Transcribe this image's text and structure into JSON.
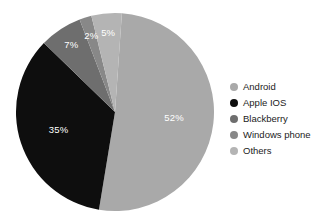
{
  "chart_data": {
    "type": "pie",
    "title": "",
    "subtitle": "",
    "xlabel": "",
    "ylabel": "",
    "grid": false,
    "legend_position": "right",
    "start_angle_deg": 4,
    "direction": "clockwise",
    "units": "percent",
    "total": 101,
    "categories": [
      "Android",
      "Apple IOS",
      "Blackberry",
      "Windows phone",
      "Others"
    ],
    "values": [
      52,
      35,
      7,
      2,
      5
    ],
    "data_labels": [
      "52%",
      "35%",
      "7%",
      "2%",
      "5%"
    ],
    "colors": [
      "#a9a9a9",
      "#0e0e0e",
      "#6e6e6e",
      "#888888",
      "#b4b4b4"
    ],
    "label_color": "#ffffff",
    "slices": [
      {
        "name": "Android",
        "value": 52,
        "label": "52%",
        "color": "#a9a9a9"
      },
      {
        "name": "Apple IOS",
        "value": 35,
        "label": "35%",
        "color": "#0e0e0e"
      },
      {
        "name": "Blackberry",
        "value": 7,
        "label": "7%",
        "color": "#6e6e6e"
      },
      {
        "name": "Windows phone",
        "value": 2,
        "label": "2%",
        "color": "#888888"
      },
      {
        "name": "Others",
        "value": 5,
        "label": "5%",
        "color": "#b4b4b4"
      }
    ]
  },
  "legend": {
    "items": [
      {
        "label": "Android",
        "color": "#a9a9a9"
      },
      {
        "label": "Apple IOS",
        "color": "#0e0e0e"
      },
      {
        "label": "Blackberry",
        "color": "#6e6e6e"
      },
      {
        "label": "Windows phone",
        "color": "#888888"
      },
      {
        "label": "Others",
        "color": "#b4b4b4"
      }
    ]
  },
  "slice_labels": {
    "android": "52%",
    "apple_ios": "35%",
    "blackberry": "7%",
    "windows_phone": "2%",
    "others": "5%"
  }
}
